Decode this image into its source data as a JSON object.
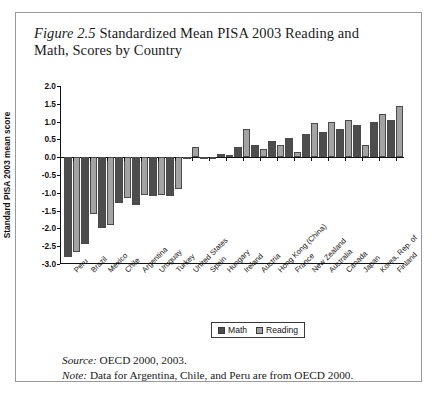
{
  "figure": {
    "number": "Figure 2.5",
    "title": "Standardized Mean PISA 2003 Reading and Math, Scores by Country",
    "source_lead": "Source:",
    "source_text": " OECD 2000, 2003.",
    "note_lead": "Note:",
    "note_text": " Data for Argentina, Chile, and Peru are from OECD 2000."
  },
  "legend": {
    "position": "bottom-center",
    "items": [
      {
        "label": "Math",
        "color": "#4d4d4d"
      },
      {
        "label": "Reading",
        "color": "#a3a3a3"
      }
    ]
  },
  "chart_data": {
    "type": "bar",
    "title": "Standardized Mean PISA 2003 Reading and Math, Scores by Country",
    "xlabel": "",
    "ylabel": "Standard PISA 2003 mean score",
    "ylim": [
      -3.0,
      2.0
    ],
    "yticks": [
      2.0,
      1.5,
      1.0,
      0.5,
      0.0,
      -0.5,
      -1.0,
      -1.5,
      -2.0,
      -2.5,
      -3.0
    ],
    "ytick_labels": [
      "2.0",
      "1.5",
      "1.0",
      "0.5",
      "0.0",
      "-0.5",
      "-1.0",
      "-1.5",
      "-2.0",
      "-2.5",
      "-3.0"
    ],
    "grid": false,
    "categories": [
      "Peru",
      "Brazil",
      "Mexico",
      "Chile",
      "Argentina",
      "Uruguay",
      "Turkey",
      "United States",
      "Spain",
      "Hungary",
      "Ireland",
      "Austria",
      "Hong Kong (China)",
      "France",
      "New Zealand",
      "Australia",
      "Canada",
      "Japan",
      "Korea, Rep. of",
      "Finland"
    ],
    "series": [
      {
        "name": "Math",
        "color": "#4d4d4d",
        "values": [
          -2.8,
          -2.45,
          -2.0,
          -1.3,
          -1.35,
          -1.1,
          -1.1,
          -0.05,
          -0.02,
          0.1,
          0.3,
          0.35,
          0.45,
          0.55,
          0.65,
          0.7,
          0.8,
          0.9,
          1.0,
          1.05
        ]
      },
      {
        "name": "Reading",
        "color": "#a3a3a3",
        "values": [
          -2.65,
          -1.6,
          -1.9,
          -1.15,
          -1.05,
          -1.05,
          -0.9,
          0.3,
          -0.02,
          0.05,
          0.8,
          0.22,
          0.33,
          0.15,
          0.95,
          1.0,
          1.05,
          0.35,
          1.2,
          1.45
        ]
      }
    ]
  }
}
